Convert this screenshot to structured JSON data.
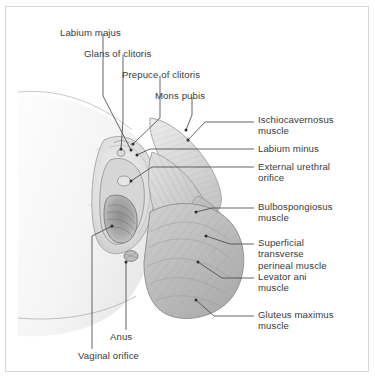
{
  "figure": {
    "border_color": "#d8d8d8",
    "background_color": "#ffffff",
    "text_color": "#3a3a3c",
    "leader_color": "#4a4a4c"
  },
  "labels": {
    "top": [
      {
        "id": "labium-majus",
        "text": "Labium majus",
        "x": 60,
        "y": 27
      },
      {
        "id": "glans-of-clitoris",
        "text": "Glans of clitoris",
        "x": 84,
        "y": 48
      },
      {
        "id": "prepuce-of-clitoris",
        "text": "Prepuce of clitoris",
        "x": 122,
        "y": 69
      },
      {
        "id": "mons-pubis",
        "text": "Mons pubis",
        "x": 155,
        "y": 90
      }
    ],
    "right": [
      {
        "id": "ischiocavernosus-muscle",
        "text": "Ischiocavernosus\nmuscle",
        "x": 258,
        "y": 114
      },
      {
        "id": "labium-minus",
        "text": "Labium minus",
        "x": 258,
        "y": 145
      },
      {
        "id": "external-urethral-orifice",
        "text": "External urethral\norifice",
        "x": 258,
        "y": 163
      },
      {
        "id": "bulbospongiosus-muscle",
        "text": "Bulbospongiosus\nmuscle",
        "x": 258,
        "y": 200
      },
      {
        "id": "superficial-transverse-perineal-muscle",
        "text": "Superficial\ntransverse\nperineal muscle",
        "x": 258,
        "y": 236
      },
      {
        "id": "levator-ani-muscle",
        "text": "Levator ani\nmuscle",
        "x": 258,
        "y": 270
      },
      {
        "id": "gluteus-maximus-muscle",
        "text": "Gluteus maximus\nmuscle",
        "x": 258,
        "y": 308
      }
    ],
    "bottom": [
      {
        "id": "anus",
        "text": "Anus",
        "x": 110,
        "y": 333
      },
      {
        "id": "vaginal-orifice",
        "text": "Vaginal orifice",
        "x": 78,
        "y": 352
      }
    ]
  }
}
